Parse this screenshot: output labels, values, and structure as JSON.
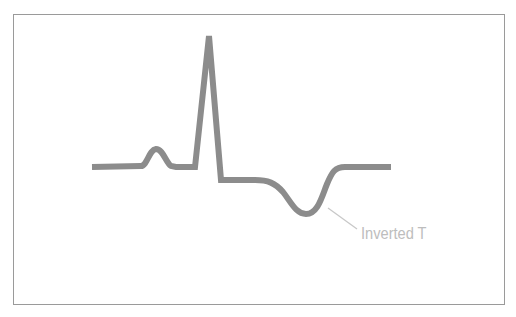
{
  "diagram": {
    "type": "ecg-waveform",
    "frame": {
      "border_color": "#9a9a9a"
    },
    "waveform": {
      "stroke_color": "#8c8c8c",
      "stroke_width": 6,
      "segments": [
        {
          "name": "baseline-start",
          "from": [
            92,
            167
          ],
          "to": [
            145,
            166
          ]
        },
        {
          "name": "p-wave",
          "peak": [
            157,
            149
          ]
        },
        {
          "name": "pr-segment",
          "from": [
            175,
            167
          ],
          "to": [
            195,
            167
          ]
        },
        {
          "name": "r-wave",
          "peak": [
            209,
            36
          ]
        },
        {
          "name": "s-point",
          "at": [
            221,
            180
          ]
        },
        {
          "name": "st-segment",
          "from": [
            221,
            180
          ],
          "to": [
            262,
            180
          ]
        },
        {
          "name": "t-wave-inverted",
          "trough": [
            307,
            214
          ]
        },
        {
          "name": "baseline-end",
          "from": [
            345,
            167
          ],
          "to": [
            391,
            167
          ]
        }
      ]
    },
    "annotation": {
      "label": "Inverted T",
      "color": "#bdbdbd",
      "leader_line": {
        "from": [
          328,
          208
        ],
        "to": [
          357,
          229
        ]
      }
    }
  }
}
